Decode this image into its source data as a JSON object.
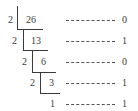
{
  "diagram": {
    "title": "",
    "type": "repeated-division-by-2",
    "divisor": "2",
    "steps": [
      {
        "divisor": "2",
        "dividend": "26",
        "remainder": "0"
      },
      {
        "divisor": "2",
        "dividend": "13",
        "remainder": "1"
      },
      {
        "divisor": "2",
        "dividend": "6",
        "remainder": "0"
      },
      {
        "divisor": "2",
        "dividend": "3",
        "remainder": "1"
      }
    ],
    "final_quotient": "1",
    "final_remainder": "1",
    "dash_text": "----------"
  }
}
